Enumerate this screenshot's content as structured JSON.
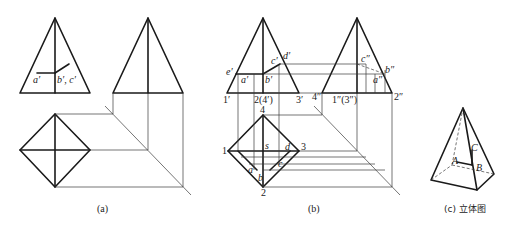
{
  "figure": {
    "panels": [
      {
        "id": "a",
        "caption": "(a)",
        "front_view_labels": {
          "a": "a′",
          "bc": "b′, c′"
        }
      },
      {
        "id": "b",
        "caption": "(b)",
        "front_view_labels": {
          "e": "e′",
          "a": "a′",
          "b": "b′",
          "c": "c′",
          "d": "d′",
          "p1": "1′",
          "p24": "2(4′)",
          "p3": "3′"
        },
        "side_view_labels": {
          "c": "c″",
          "b": "b″",
          "a": "a″",
          "p4": "4″",
          "p13": "1″(3″)",
          "p2": "2″"
        },
        "top_view_labels": {
          "p1": "1",
          "p2": "2",
          "p3": "3",
          "p4": "4",
          "s": "s",
          "a": "a",
          "b": "b",
          "c": "c",
          "d": "d"
        }
      },
      {
        "id": "c",
        "caption": "(c) 立体图",
        "labels": {
          "A": "A",
          "B": "B",
          "C": "C"
        }
      }
    ]
  }
}
